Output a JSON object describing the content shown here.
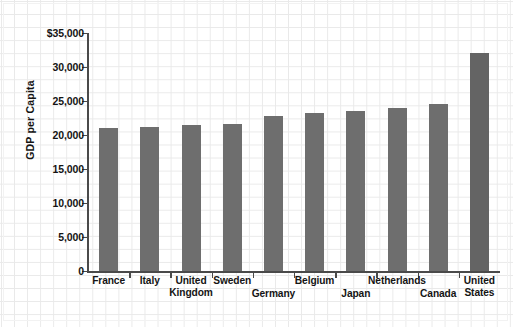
{
  "chart_data": {
    "type": "bar",
    "title": "",
    "xlabel": "",
    "ylabel": "GDP per Capita",
    "ylim": [
      0,
      35000
    ],
    "grid": true,
    "legend": "none",
    "orientation": "vertical",
    "bar_color": "#6e6e6e",
    "categories": [
      "France",
      "Italy",
      "United Kingdom",
      "Sweden",
      "Germany",
      "Belgium",
      "Japan",
      "Netherlands",
      "Canada",
      "United States"
    ],
    "values": [
      21000,
      21200,
      21500,
      21600,
      22800,
      23300,
      23600,
      23900,
      24600,
      32000
    ],
    "ytick_labels": [
      "$35,000",
      "30,000",
      "25,000",
      "20,000",
      "15,000",
      "10,000",
      "5,000",
      "0"
    ],
    "ytick_values": [
      35000,
      30000,
      25000,
      20000,
      15000,
      10000,
      5000,
      0
    ]
  },
  "axis": {
    "y_title": "GDP per Capita"
  },
  "categories_display": [
    {
      "line1": "France",
      "line2": "",
      "row": 0
    },
    {
      "line1": "Italy",
      "line2": "",
      "row": 0
    },
    {
      "line1": "United",
      "line2": "Kingdom",
      "row": 0
    },
    {
      "line1": "Sweden",
      "line2": "",
      "row": 0
    },
    {
      "line1": "Germany",
      "line2": "",
      "row": 1
    },
    {
      "line1": "Belgium",
      "line2": "",
      "row": 0
    },
    {
      "line1": "Japan",
      "line2": "",
      "row": 1
    },
    {
      "line1": "Netherlands",
      "line2": "",
      "row": 0
    },
    {
      "line1": "Canada",
      "line2": "",
      "row": 1
    },
    {
      "line1": "United",
      "line2": "States",
      "row": 0
    }
  ]
}
